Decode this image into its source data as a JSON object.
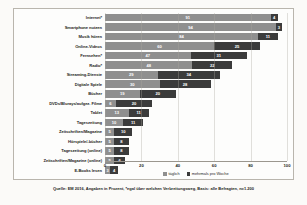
{
  "chart_data": {
    "type": "bar",
    "orientation": "horizontal",
    "stacked": true,
    "title": "",
    "xlabel": "",
    "ylabel": "",
    "xlim": [
      0,
      100
    ],
    "xticks": [
      "0",
      "20",
      "40",
      "60",
      "80",
      "100"
    ],
    "grid": true,
    "legend_position": "bottom",
    "categories": [
      "Internet*",
      "Smartphone nutzen",
      "Musik hören",
      "Online-Videos",
      "Fernsehen*",
      "Radio*",
      "Streaming-Dienste",
      "Digitale Spiele",
      "Bücher",
      "DVDs/Blurays/aufgez. Filme",
      "Tablet",
      "Tageszeitung",
      "Zeitschriften/Magazine",
      "Hörspiele/-bücher",
      "Tageszeitung (online)",
      "Zeitschriften/Magazine (online)",
      "E-Books lesen"
    ],
    "series": [
      {
        "name": "täglich",
        "color": "#8f8f8f",
        "values": [
          91,
          94,
          84,
          60,
          47,
          48,
          29,
          30,
          19,
          6,
          13,
          10,
          5,
          5,
          5,
          5,
          3
        ]
      },
      {
        "name": "mehrmals pro Woche",
        "color": "#3b3b3b",
        "values": [
          4,
          3,
          11,
          25,
          31,
          22,
          34,
          28,
          20,
          20,
          11,
          11,
          10,
          8,
          8,
          6,
          4
        ]
      }
    ],
    "source_note": "Quelle: EM 2016, Angaben in Prozent, *egal über welchen Verbreitungsweg, Basis: alle Befragten, n=1.200"
  }
}
